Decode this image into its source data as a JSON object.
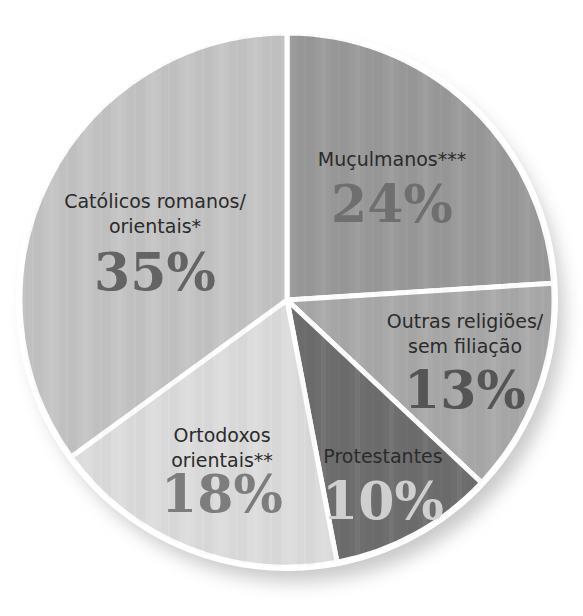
{
  "chart_data": {
    "type": "pie",
    "title": "",
    "start_angle_deg": 0,
    "direction": "clockwise",
    "slices": [
      {
        "label": "Muçulmanos***",
        "lines": [
          "Muçulmanos***"
        ],
        "value": 24,
        "display": "24%",
        "color": "#9a9a9a",
        "pct_color": "#6f6f6f"
      },
      {
        "label": "Outras religiões/ sem filiação",
        "lines": [
          "Outras religiões/",
          "sem filiação"
        ],
        "value": 13,
        "display": "13%",
        "color": "#a9a9a9",
        "pct_color": "#555555"
      },
      {
        "label": "Protestantes",
        "lines": [
          "Protestantes"
        ],
        "value": 10,
        "display": "10%",
        "color": "#6e6e6e",
        "pct_color": "#cfcfcf"
      },
      {
        "label": "Ortodoxos orientais**",
        "lines": [
          "Ortodoxos",
          "orientais**"
        ],
        "value": 18,
        "display": "18%",
        "color": "#dcdcdc",
        "pct_color": "#7d7d7d"
      },
      {
        "label": "Católicos romanos/ orientais*",
        "lines": [
          "Católicos romanos/",
          "orientais*"
        ],
        "value": 35,
        "display": "35%",
        "color": "#c4c4c4",
        "pct_color": "#646464"
      }
    ],
    "legend": "none",
    "grid": false
  },
  "colors": {
    "separator": "#ffffff",
    "shadow": "#9e9e9e",
    "label_text": "#2b2b2b"
  }
}
